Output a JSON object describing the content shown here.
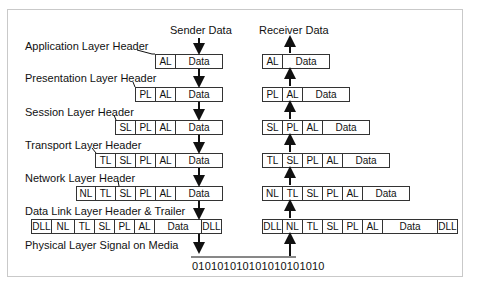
{
  "diagram": {
    "title_sender": "Sender Data",
    "title_receiver": "Receiver Data",
    "layers": [
      {
        "label": "Application Layer Header",
        "sender": [
          "AL",
          "Data"
        ],
        "receiver": [
          "AL",
          "Data"
        ]
      },
      {
        "label": "Presentation Layer Header",
        "sender": [
          "PL",
          "AL",
          "Data"
        ],
        "receiver": [
          "PL",
          "AL",
          "Data"
        ]
      },
      {
        "label": "Session Layer Header",
        "sender": [
          "SL",
          "PL",
          "AL",
          "Data"
        ],
        "receiver": [
          "SL",
          "PL",
          "AL",
          "Data"
        ]
      },
      {
        "label": "Transport Layer Header",
        "sender": [
          "TL",
          "SL",
          "PL",
          "AL",
          "Data"
        ],
        "receiver": [
          "TL",
          "SL",
          "PL",
          "AL",
          "Data"
        ]
      },
      {
        "label": "Network Layer Header",
        "sender": [
          "NL",
          "TL",
          "SL",
          "PL",
          "AL",
          "Data"
        ],
        "receiver": [
          "NL",
          "TL",
          "SL",
          "PL",
          "AL",
          "Data"
        ]
      },
      {
        "label": "Data Link Layer Header & Trailer",
        "sender": [
          "DLL",
          "NL",
          "TL",
          "SL",
          "PL",
          "AL",
          "Data",
          "DLL"
        ],
        "receiver": [
          "DLL",
          "NL",
          "TL",
          "SL",
          "PL",
          "AL",
          "Data",
          "DLL"
        ]
      }
    ],
    "physical_label": "Physical Layer  Signal on Media",
    "bits": "010101010101010101010"
  }
}
